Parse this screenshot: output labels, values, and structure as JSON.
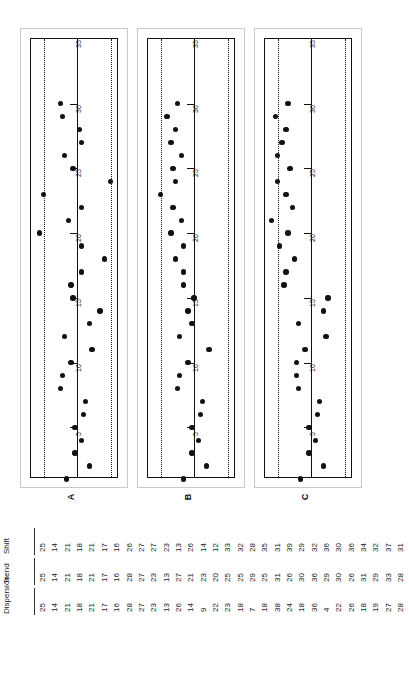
{
  "figure": {
    "panels": [
      {
        "label": "A",
        "series_name": "Dispersion",
        "axis_ticks": [
          5,
          10,
          15,
          20,
          25,
          30
        ],
        "axis_min": 1,
        "axis_max": 35,
        "center": 20.0,
        "lcl": 4.0,
        "ucl": 36.0,
        "values": [
          25,
          14,
          21,
          18,
          21,
          17,
          16,
          28,
          27,
          23,
          13,
          26,
          14,
          9,
          22,
          23,
          18,
          7,
          18,
          38,
          24,
          18,
          36,
          4,
          22,
          26,
          18,
          19,
          27,
          28
        ]
      },
      {
        "label": "B",
        "series_name": "Trend",
        "axis_ticks": [
          5,
          10,
          15,
          20,
          25,
          30
        ],
        "axis_min": 1,
        "axis_max": 35,
        "center": 20.0,
        "lcl": 4.0,
        "ucl": 36.0,
        "values": [
          25,
          14,
          21,
          18,
          21,
          17,
          16,
          28,
          27,
          23,
          13,
          27,
          21,
          23,
          20,
          25,
          25,
          29,
          25,
          31,
          26,
          30,
          36,
          29,
          30,
          26,
          31,
          29,
          33,
          28
        ]
      },
      {
        "label": "C",
        "series_name": "Shift",
        "axis_ticks": [
          5,
          10,
          15,
          20,
          25,
          30
        ],
        "axis_min": 1,
        "axis_max": 35,
        "center": 20.0,
        "lcl": 4.0,
        "ucl": 36.0,
        "values": [
          25,
          14,
          21,
          18,
          21,
          17,
          16,
          26,
          27,
          27,
          23,
          13,
          26,
          14,
          12,
          33,
          32,
          28,
          35,
          31,
          39,
          29,
          32,
          36,
          30,
          36,
          34,
          32,
          37,
          31
        ]
      }
    ]
  },
  "table": {
    "rows": [
      {
        "header": "Shift",
        "values": [
          25,
          14,
          21,
          18,
          21,
          17,
          16,
          26,
          27,
          27,
          23,
          13,
          26,
          14,
          12,
          33,
          32,
          28,
          35,
          31,
          39,
          29,
          32,
          36,
          30,
          36,
          34,
          32,
          37,
          31
        ]
      },
      {
        "header": "Trend",
        "values": [
          25,
          14,
          21,
          18,
          21,
          17,
          16,
          28,
          27,
          23,
          13,
          27,
          21,
          23,
          20,
          25,
          25,
          29,
          25,
          31,
          26,
          30,
          36,
          29,
          30,
          26,
          31,
          29,
          33,
          28
        ]
      },
      {
        "header": "Dispersion",
        "values": [
          25,
          14,
          21,
          18,
          21,
          17,
          16,
          28,
          27,
          23,
          13,
          26,
          14,
          9,
          22,
          23,
          18,
          7,
          18,
          38,
          24,
          18,
          36,
          4,
          22,
          26,
          18,
          19,
          27,
          28
        ]
      }
    ]
  },
  "chart_data": {
    "type": "line",
    "xlabel": "Observation (run order)",
    "ylabel": "Value",
    "x": [
      1,
      2,
      3,
      4,
      5,
      6,
      7,
      8,
      9,
      10,
      11,
      12,
      13,
      14,
      15,
      16,
      17,
      18,
      19,
      20,
      21,
      22,
      23,
      24,
      25,
      26,
      27,
      28,
      29,
      30
    ],
    "xlim": [
      1,
      35
    ],
    "ylim": [
      0,
      42
    ],
    "grid": false,
    "legend": "none",
    "orientation": "rotated-90ccw",
    "panels": [
      "A",
      "B",
      "C"
    ],
    "annotations": [
      "center line (solid)",
      "upper control limit (dotted)",
      "lower control limit (dotted)"
    ],
    "series": [
      {
        "name": "Dispersion",
        "panel": "A",
        "center_line": 20.0,
        "ucl": 36.0,
        "lcl": 4.0,
        "values": [
          25,
          14,
          21,
          18,
          21,
          17,
          16,
          28,
          27,
          23,
          13,
          26,
          14,
          9,
          22,
          23,
          18,
          7,
          18,
          38,
          24,
          18,
          36,
          4,
          22,
          26,
          18,
          19,
          27,
          28
        ]
      },
      {
        "name": "Trend",
        "panel": "B",
        "center_line": 20.0,
        "ucl": 36.0,
        "lcl": 4.0,
        "values": [
          25,
          14,
          21,
          18,
          21,
          17,
          16,
          28,
          27,
          23,
          13,
          27,
          21,
          23,
          20,
          25,
          25,
          29,
          25,
          31,
          26,
          30,
          36,
          29,
          30,
          26,
          31,
          29,
          33,
          28
        ]
      },
      {
        "name": "Shift",
        "panel": "C",
        "center_line": 20.0,
        "ucl": 36.0,
        "lcl": 4.0,
        "values": [
          25,
          14,
          21,
          18,
          21,
          17,
          16,
          26,
          27,
          27,
          23,
          13,
          26,
          14,
          12,
          33,
          32,
          28,
          35,
          31,
          39,
          29,
          32,
          36,
          30,
          36,
          34,
          32,
          37,
          31
        ]
      }
    ]
  }
}
